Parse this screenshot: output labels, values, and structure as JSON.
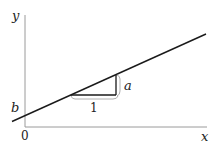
{
  "diagram": {
    "axes": {
      "x_label": "x",
      "y_label": "y",
      "origin_label": "0"
    },
    "labels": {
      "intercept": "b",
      "rise": "a",
      "run": "1"
    },
    "colors": {
      "axis": "#9a9a9a",
      "line": "#1a1a1a",
      "bracket": "#b0b0b0",
      "text": "#222222"
    }
  }
}
